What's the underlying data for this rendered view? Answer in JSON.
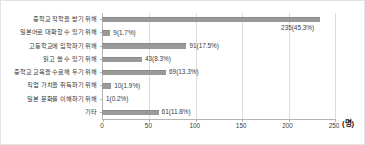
{
  "chart_data": {
    "type": "bar",
    "orientation": "horizontal",
    "title": "",
    "xlabel": "(명)",
    "ylabel": "",
    "xlim": [
      0,
      250
    ],
    "xticks": [
      0,
      50,
      100,
      150,
      200,
      250
    ],
    "grid": true,
    "legend": null,
    "unit": "(명)",
    "bar_color": "#9a9a9a",
    "categories": [
      "중학교 작학을 받기 위해",
      "일본어로 대화할 수 있기 위해",
      "고등학교에 입학하기 위해",
      "읽고 쓸 수 있기 위해",
      "중학교 교육을 수료해 두기 위해",
      "직업 가치을 취득하기 위해",
      "일본 문화를 이해하기 위해",
      "기타"
    ],
    "values": [
      235,
      9,
      91,
      43,
      69,
      10,
      1,
      61
    ],
    "percents": [
      45.3,
      1.7,
      17.5,
      8.3,
      13.3,
      1.9,
      0.2,
      11.8
    ],
    "labels": [
      "235(45.3%)",
      "9(1.7%)",
      "91(17.5%)",
      "43(8.3%)",
      "69(13.3%)",
      "10(1.9%)",
      "1(0.2%)",
      "61(11.8%)"
    ]
  }
}
